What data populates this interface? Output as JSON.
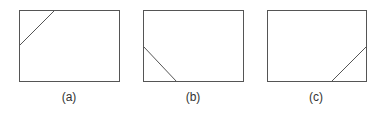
{
  "panels": [
    {
      "label": "(a)",
      "rect": [
        19,
        10,
        100,
        71
      ],
      "line": [
        19,
        45,
        54,
        10
      ],
      "label_x": 69
    },
    {
      "label": "(b)",
      "rect": [
        143,
        10,
        100,
        71
      ],
      "line": [
        143,
        46,
        176,
        81
      ],
      "label_x": 193
    },
    {
      "label": "(c)",
      "rect": [
        267,
        10,
        99,
        71
      ],
      "line": [
        331,
        81,
        366,
        46
      ],
      "label_x": 316
    }
  ],
  "colors": {
    "stroke": "#555555",
    "text": "#333333"
  }
}
